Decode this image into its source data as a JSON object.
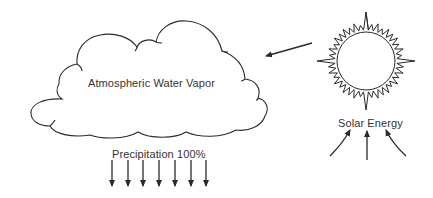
{
  "diagram": {
    "type": "water-cycle-energy",
    "nodes": {
      "cloud": {
        "label": "Atmospheric Water Vapor",
        "shape": "cloud-icon"
      },
      "sun": {
        "label": "Solar Energy",
        "shape": "sun-icon"
      }
    },
    "edges": [
      {
        "from": "sun",
        "to": "cloud",
        "kind": "arrow"
      }
    ],
    "precipitation": {
      "label": "Precipitation 100%",
      "arrow_count": 7,
      "direction": "down"
    },
    "solar_input_arrows": {
      "count": 3,
      "direction": "up"
    },
    "colors": {
      "stroke": "#2a2a2a",
      "background": "#ffffff"
    }
  }
}
